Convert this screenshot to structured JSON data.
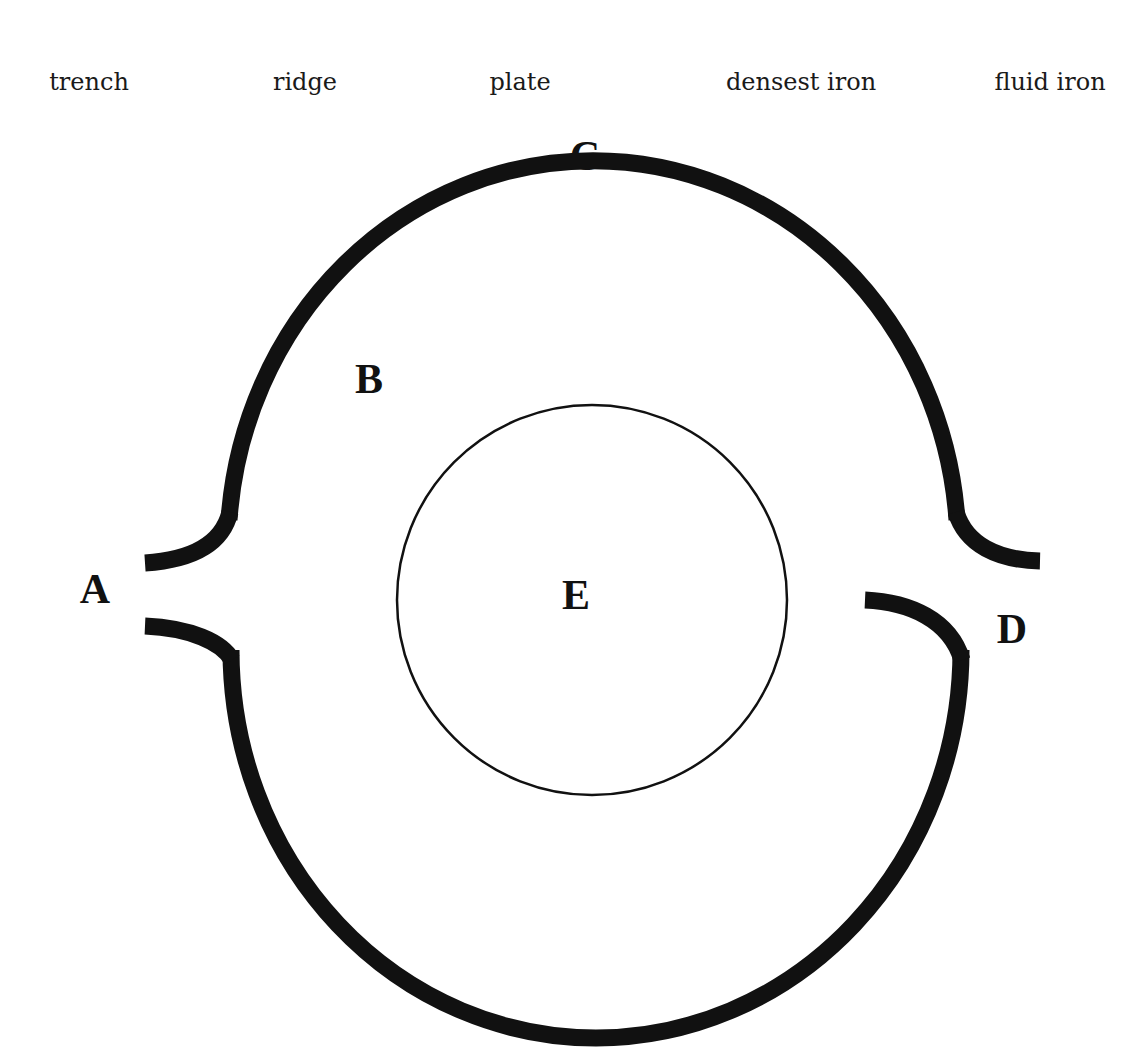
{
  "word_bank": [
    {
      "text": "trench",
      "x": 89
    },
    {
      "text": "ridge",
      "x": 305
    },
    {
      "text": "plate",
      "x": 520
    },
    {
      "text": "densest iron",
      "x": 801
    },
    {
      "text": "fluid iron",
      "x": 1050
    }
  ],
  "labels": {
    "A": "A",
    "B": "B",
    "C": "C",
    "D": "D",
    "E": "E"
  },
  "colors": {
    "stroke": "#111111",
    "background": "#ffffff"
  }
}
